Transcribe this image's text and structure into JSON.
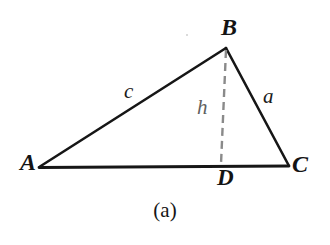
{
  "figure": {
    "caption": "(a)",
    "background_color": "#ffffff",
    "stroke_color": "#161616",
    "dash_color": "#8a8a8a"
  },
  "vertices": [
    {
      "id": "A",
      "label": "A",
      "x": 40,
      "y": 167
    },
    {
      "id": "B",
      "label": "B",
      "x": 226,
      "y": 48
    },
    {
      "id": "C",
      "label": "C",
      "x": 288,
      "y": 166
    },
    {
      "id": "D",
      "label": "D",
      "x": 221,
      "y": 164
    }
  ],
  "sides": [
    {
      "id": "c",
      "label": "c",
      "from": "A",
      "to": "B"
    },
    {
      "id": "a",
      "label": "a",
      "from": "B",
      "to": "C"
    },
    {
      "id": "b",
      "label": "",
      "from": "A",
      "to": "C"
    }
  ],
  "altitude": {
    "label": "h",
    "from": "B",
    "to": "D",
    "style": "dashed",
    "color": "#8a8a8a"
  }
}
